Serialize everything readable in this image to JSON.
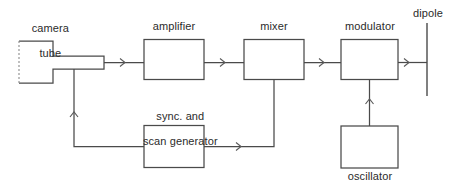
{
  "diagram": {
    "background_color": "#ffffff",
    "line_color": "#4a4a4a",
    "text_color": "#2b2b2b",
    "blocks": [
      {
        "id": "camera-tube",
        "label": "camera\ntube",
        "label_position": "above"
      },
      {
        "id": "amplifier",
        "label": "amplifier",
        "label_position": "above"
      },
      {
        "id": "mixer",
        "label": "mixer",
        "label_position": "above"
      },
      {
        "id": "modulator",
        "label": "modulator",
        "label_position": "above"
      },
      {
        "id": "dipole",
        "label": "dipole",
        "label_position": "above"
      },
      {
        "id": "sync-scan-generator",
        "label": "sync. and\nscan generator",
        "label_position": "above"
      },
      {
        "id": "oscillator",
        "label": "oscillator",
        "label_position": "below"
      }
    ],
    "labels": {
      "camera_tube_line1": "camera",
      "camera_tube_line2": "tube",
      "amplifier": "amplifier",
      "mixer": "mixer",
      "modulator": "modulator",
      "dipole": "dipole",
      "sync_scan_line1": "sync. and",
      "sync_scan_line2": "scan generator",
      "oscillator": "oscillator"
    },
    "connections": [
      {
        "from": "camera-tube",
        "to": "amplifier",
        "direction": "right"
      },
      {
        "from": "amplifier",
        "to": "mixer",
        "direction": "right"
      },
      {
        "from": "mixer",
        "to": "modulator",
        "direction": "right"
      },
      {
        "from": "modulator",
        "to": "dipole",
        "direction": "right"
      },
      {
        "from": "sync-scan-generator",
        "to": "camera-tube",
        "direction": "up"
      },
      {
        "from": "sync-scan-generator",
        "to": "mixer",
        "direction": "right-up"
      },
      {
        "from": "oscillator",
        "to": "modulator",
        "direction": "up"
      }
    ]
  }
}
